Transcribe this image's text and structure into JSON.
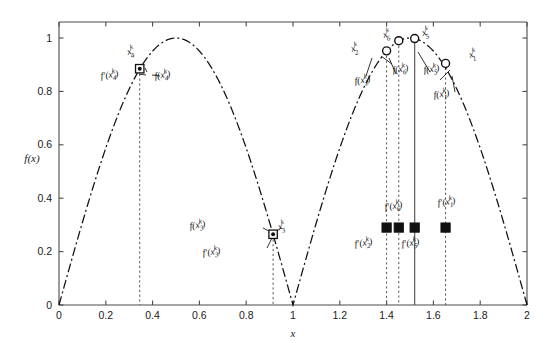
{
  "chart_data": {
    "type": "line",
    "title": "",
    "xlabel": "x",
    "ylabel": "f(x)",
    "xlim": [
      0,
      2
    ],
    "ylim": [
      0,
      1.06
    ],
    "grid": false,
    "legend": "none",
    "xticks": [
      "0",
      "0.2",
      "0.4",
      "0.6",
      "0.8",
      "1",
      "1.2",
      "1.4",
      "1.6",
      "1.8",
      "2"
    ],
    "xtick_values": [
      0,
      0.2,
      0.4,
      0.6,
      0.8,
      1.0,
      1.2,
      1.4,
      1.6,
      1.8,
      2.0
    ],
    "yticks": [
      "0",
      "0.2",
      "0.4",
      "0.6",
      "0.8",
      "1"
    ],
    "ytick_values": [
      0,
      0.2,
      0.4,
      0.6,
      0.8,
      1.0
    ],
    "series": [
      {
        "name": "f(x) = |sin(pi x)|",
        "style": "dash-dot",
        "color": "#111111",
        "description": "Two-lobe curve: rises from (0,0) to peak 1.0 at x=0.5, falls to 0 at x=1.0, rises again to peak 1.0 at x=1.5, falls to 0 at x=2.0"
      }
    ],
    "points_on_curve": [
      {
        "id": "x4",
        "x": 0.345,
        "y": 0.885,
        "marker": "open-square-circle",
        "labels": [
          "x_4^k",
          "f'(x_4^k)",
          "f(x_4^k)"
        ]
      },
      {
        "id": "x3",
        "x": 0.915,
        "y": 0.265,
        "marker": "open-square-circle",
        "labels": [
          "x_3^k",
          "f(x_3^k)",
          "f'(x_3^k)"
        ]
      },
      {
        "id": "x2",
        "x": 1.4,
        "y": 0.952,
        "marker": "circle",
        "labels": [
          "x_2^k",
          "f(x_2^k)"
        ]
      },
      {
        "id": "x6",
        "x": 1.452,
        "y": 0.99,
        "marker": "circle",
        "labels": [
          "x_6^k",
          "f(x_6^k)"
        ]
      },
      {
        "id": "x5",
        "x": 1.52,
        "y": 0.998,
        "marker": "circle",
        "labels": [
          "x_5^k",
          "f(x_5^k)"
        ]
      },
      {
        "id": "x1",
        "x": 1.652,
        "y": 0.905,
        "marker": "circle",
        "labels": [
          "x_1^k",
          "f(x_1^k)"
        ]
      }
    ],
    "derivative_markers": [
      {
        "id": "dx2",
        "x": 1.4,
        "y": 0.29,
        "marker": "filled-square",
        "label": "f'(x_2^k)"
      },
      {
        "id": "dx6",
        "x": 1.452,
        "y": 0.29,
        "marker": "filled-square",
        "label": "f'(x_6^k)"
      },
      {
        "id": "dx5",
        "x": 1.52,
        "y": 0.29,
        "marker": "filled-square",
        "label": "f'(x_5^k)"
      },
      {
        "id": "dx1",
        "x": 1.652,
        "y": 0.29,
        "marker": "filled-square",
        "label": "f'(x_1^k)"
      }
    ],
    "vertical_lines": [
      {
        "x": 0.345,
        "style": "dashed"
      },
      {
        "x": 0.915,
        "style": "dashed"
      },
      {
        "x": 1.4,
        "style": "dashed"
      },
      {
        "x": 1.452,
        "style": "dashed"
      },
      {
        "x": 1.52,
        "style": "solid"
      },
      {
        "x": 1.652,
        "style": "dashed"
      }
    ],
    "annotations": [
      "x_1^k",
      "x_2^k",
      "x_3^k",
      "x_4^k",
      "x_5^k",
      "x_6^k",
      "f(x_1^k)",
      "f(x_2^k)",
      "f(x_3^k)",
      "f(x_4^k)",
      "f(x_5^k)",
      "f(x_6^k)",
      "f'(x_1^k)",
      "f'(x_2^k)",
      "f'(x_3^k)",
      "f'(x_4^k)",
      "f'(x_5^k)",
      "f'(x_6^k)"
    ]
  },
  "axes": {
    "x_title": "x",
    "y_title": "f(x)",
    "x_ticks": [
      {
        "label": "0",
        "value": 0
      },
      {
        "label": "0.2",
        "value": 0.2
      },
      {
        "label": "0.4",
        "value": 0.4
      },
      {
        "label": "0.6",
        "value": 0.6
      },
      {
        "label": "0.8",
        "value": 0.8
      },
      {
        "label": "1",
        "value": 1.0
      },
      {
        "label": "1.2",
        "value": 1.2
      },
      {
        "label": "1.4",
        "value": 1.4
      },
      {
        "label": "1.6",
        "value": 1.6
      },
      {
        "label": "1.8",
        "value": 1.8
      },
      {
        "label": "2",
        "value": 2.0
      }
    ],
    "y_ticks": [
      {
        "label": "0",
        "value": 0
      },
      {
        "label": "0.2",
        "value": 0.2
      },
      {
        "label": "0.4",
        "value": 0.4
      },
      {
        "label": "0.6",
        "value": 0.6
      },
      {
        "label": "0.8",
        "value": 0.8
      },
      {
        "label": "1",
        "value": 1.0
      }
    ]
  },
  "labels": {
    "x1": {
      "base": "x",
      "sub": "1",
      "sup": "k"
    },
    "x2": {
      "base": "x",
      "sub": "2",
      "sup": "k"
    },
    "x3": {
      "base": "x",
      "sub": "3",
      "sup": "k"
    },
    "x4": {
      "base": "x",
      "sub": "4",
      "sup": "k"
    },
    "x5": {
      "base": "x",
      "sub": "5",
      "sup": "k"
    },
    "x6": {
      "base": "x",
      "sub": "6",
      "sup": "k"
    },
    "fx1": {
      "prefix": "f(x",
      "sub": "1",
      "sup": "k",
      "suffix": ")"
    },
    "fx2": {
      "prefix": "f(x",
      "sub": "2",
      "sup": "k",
      "suffix": ")"
    },
    "fx3": {
      "prefix": "f(x",
      "sub": "3",
      "sup": "k",
      "suffix": ")"
    },
    "fx4": {
      "prefix": "f(x",
      "sub": "4",
      "sup": "k",
      "suffix": ")"
    },
    "fx5": {
      "prefix": "f(x",
      "sub": "5",
      "sup": "k",
      "suffix": ")"
    },
    "fx6": {
      "prefix": "f(x",
      "sub": "6",
      "sup": "k",
      "suffix": ")"
    },
    "dfx1": {
      "prefix": "f'(x",
      "sub": "1",
      "sup": "k",
      "suffix": ")"
    },
    "dfx2": {
      "prefix": "f'(x",
      "sub": "2",
      "sup": "k",
      "suffix": ")"
    },
    "dfx3": {
      "prefix": "f'(x",
      "sub": "3",
      "sup": "k",
      "suffix": ")"
    },
    "dfx4": {
      "prefix": "f'(x",
      "sub": "4",
      "sup": "k",
      "suffix": ")"
    },
    "dfx5": {
      "prefix": "f'(x",
      "sub": "5",
      "sup": "k",
      "suffix": ")"
    },
    "dfx6": {
      "prefix": "f'(x",
      "sub": "6",
      "sup": "k",
      "suffix": ")"
    }
  },
  "colors": {
    "curve": "#111111",
    "axis": "#4a4a4a",
    "marker_fill": "#111111",
    "background": "#ffffff"
  }
}
